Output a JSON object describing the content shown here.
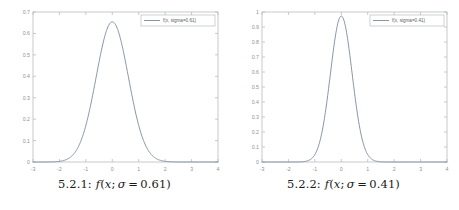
{
  "figures": [
    {
      "id": "fig-5-2-1",
      "caption_label": "5.2.1:",
      "caption_fn": "f",
      "caption_open": "(",
      "caption_x": "x",
      "caption_semi": ";",
      "caption_sigma": "σ",
      "caption_eq": "=",
      "caption_value": "0.61",
      "caption_close": ")",
      "legend_label": "f(x, sigma=0.61)",
      "chart_data": {
        "type": "line",
        "title": "",
        "xlabel": "",
        "ylabel": "",
        "xlim": [
          -3,
          4
        ],
        "ylim": [
          0,
          0.7
        ],
        "xticks": [
          -3,
          -2,
          -1,
          0,
          1,
          2,
          3,
          4
        ],
        "xticklabels": [
          "-3",
          "-2",
          "-1",
          "0",
          "1",
          "2",
          "3",
          "4"
        ],
        "yticks": [
          0,
          0.1,
          0.2,
          0.3,
          0.4,
          0.5,
          0.6,
          0.7
        ],
        "yticklabels": [
          "0",
          "0.1",
          "0.2",
          "0.3",
          "0.4",
          "0.5",
          "0.6",
          "0.7"
        ],
        "grid": false,
        "legend_position": "upper right",
        "series": [
          {
            "name": "f(x, sigma=0.61)",
            "function": "gaussian",
            "mu": 0,
            "sigma": 0.61,
            "peak": 0.654,
            "color": "#7b8a9c",
            "x": [
              -3,
              -2.8,
              -2.6,
              -2.4,
              -2.2,
              -2,
              -1.8,
              -1.6,
              -1.4,
              -1.2,
              -1,
              -0.8,
              -0.6,
              -0.4,
              -0.2,
              0,
              0.2,
              0.4,
              0.6,
              0.8,
              1,
              1.2,
              1.4,
              1.6,
              1.8,
              2,
              2.2,
              2.4,
              2.6,
              2.8,
              3,
              3.2,
              3.4,
              3.6,
              3.8,
              4
            ],
            "y": [
              0.0,
              0.0,
              0.0001,
              0.0003,
              0.0011,
              0.0033,
              0.0089,
              0.0213,
              0.0454,
              0.0866,
              0.1477,
              0.2254,
              0.3078,
              0.3761,
              0.4112,
              0.4022,
              0.4112,
              0.3761,
              0.3078,
              0.2254,
              0.1477,
              0.0866,
              0.0454,
              0.0213,
              0.0089,
              0.0033,
              0.0011,
              0.0003,
              0.0001,
              0.0,
              0.0,
              0.0,
              0.0,
              0.0,
              0.0,
              0.0
            ]
          }
        ]
      }
    },
    {
      "id": "fig-5-2-2",
      "caption_label": "5.2.2:",
      "caption_fn": "f",
      "caption_open": "(",
      "caption_x": "x",
      "caption_semi": ";",
      "caption_sigma": "σ",
      "caption_eq": "=",
      "caption_value": "0.41",
      "caption_close": ")",
      "legend_label": "f(x, sigma=0.41)",
      "chart_data": {
        "type": "line",
        "title": "",
        "xlabel": "",
        "ylabel": "",
        "xlim": [
          -3,
          4
        ],
        "ylim": [
          0,
          1
        ],
        "xticks": [
          -3,
          -2,
          -1,
          0,
          1,
          2,
          3,
          4
        ],
        "xticklabels": [
          "-3",
          "-2",
          "-1",
          "0",
          "1",
          "2",
          "3",
          "4"
        ],
        "yticks": [
          0,
          0.1,
          0.2,
          0.3,
          0.4,
          0.5,
          0.6,
          0.7,
          0.8,
          0.9,
          1
        ],
        "yticklabels": [
          "0",
          "0.1",
          "0.2",
          "0.3",
          "0.4",
          "0.5",
          "0.6",
          "0.7",
          "0.8",
          "0.9",
          "1"
        ],
        "grid": false,
        "legend_position": "upper right",
        "series": [
          {
            "name": "f(x, sigma=0.41)",
            "function": "gaussian",
            "mu": 0,
            "sigma": 0.41,
            "peak": 0.973,
            "color": "#7b8a9c",
            "x": [
              -3,
              -2.8,
              -2.6,
              -2.4,
              -2.2,
              -2,
              -1.8,
              -1.6,
              -1.4,
              -1.2,
              -1,
              -0.8,
              -0.6,
              -0.4,
              -0.2,
              0,
              0.2,
              0.4,
              0.6,
              0.8,
              1,
              1.2,
              1.4,
              1.6,
              1.8,
              2,
              2.2,
              2.4,
              2.6,
              2.8,
              3,
              3.2,
              3.4,
              3.6,
              3.8,
              4
            ],
            "y": [
              0.0,
              0.0,
              0.0,
              0.0,
              0.0,
              0.0,
              0.0001,
              0.0005,
              0.0027,
              0.0123,
              0.0443,
              0.1268,
              0.2891,
              0.5258,
              0.7635,
              0.8871,
              0.7635,
              0.5258,
              0.2891,
              0.1268,
              0.0443,
              0.0123,
              0.0027,
              0.0005,
              0.0001,
              0.0,
              0.0,
              0.0,
              0.0,
              0.0,
              0.0,
              0.0,
              0.0,
              0.0,
              0.0,
              0.0
            ]
          }
        ]
      }
    }
  ],
  "style": {
    "axis_color": "#b9bcc0",
    "tick_text_color": "#8e9296",
    "curve_color": "#7b8a9c",
    "legend_border": "#b9bcc0",
    "background": "#ffffff"
  }
}
